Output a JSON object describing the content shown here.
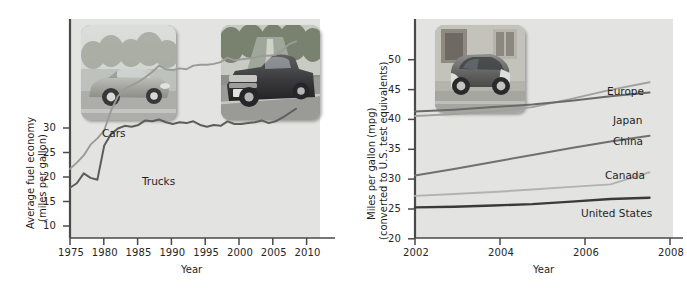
{
  "figure": {
    "background": "#ffffff",
    "plot_background": "#e3e3e1"
  },
  "chart_data": [
    {
      "id": "us-fuel-economy",
      "type": "line",
      "title": "",
      "xlabel": "Year",
      "ylabel": "Average fuel economy (miles per gallon)",
      "ylabel_line1": "Average fuel economy",
      "ylabel_line2": "(miles per gallon)",
      "xlim": [
        1975,
        2011.5
      ],
      "ylim": [
        8.2,
        32.6
      ],
      "xticks": [
        1975,
        1980,
        1985,
        1990,
        1995,
        2000,
        2005,
        2010
      ],
      "yticks": [
        10,
        15,
        20,
        25,
        30
      ],
      "grid": false,
      "legend_position": "inline-annotation",
      "series": [
        {
          "name": "Cars",
          "color": "#9a9a99",
          "label_x": 1981.2,
          "label_y": 26.6,
          "x": [
            1975,
            1976,
            1977,
            1978,
            1979,
            1980,
            1981,
            1982,
            1983,
            1984,
            1985,
            1986,
            1987,
            1988,
            1989,
            1990,
            1991,
            1992,
            1993,
            1994,
            1995,
            1996,
            1997,
            1998,
            1999,
            2000,
            2001,
            2002,
            2003,
            2004,
            2005,
            2006,
            2007,
            2008
          ],
          "values": [
            15.9,
            16.6,
            17.4,
            18.6,
            19.3,
            20.2,
            22.4,
            24.0,
            24.8,
            25.2,
            25.6,
            26.1,
            26.7,
            27.4,
            27.0,
            26.9,
            27.1,
            27.0,
            27.4,
            27.5,
            27.5,
            27.6,
            27.8,
            28.3,
            28.0,
            28.1,
            28.2,
            28.3,
            28.5,
            28.5,
            28.6,
            29.1,
            29.8,
            30.1
          ]
        },
        {
          "name": "Trucks",
          "color": "#5d5d5d",
          "label_x": 1988.2,
          "label_y": 18.4,
          "x": [
            1975,
            1976,
            1977,
            1978,
            1979,
            1980,
            1981,
            1982,
            1983,
            1984,
            1985,
            1986,
            1987,
            1988,
            1989,
            1990,
            1991,
            1992,
            1993,
            1994,
            1995,
            1996,
            1997,
            1998,
            1999,
            2000,
            2001,
            2002,
            2003,
            2004,
            2005,
            2006,
            2007,
            2008
          ],
          "values": [
            13.8,
            14.3,
            15.4,
            14.9,
            14.7,
            18.5,
            19.8,
            20.4,
            20.7,
            20.6,
            20.8,
            21.3,
            21.2,
            21.4,
            21.1,
            20.9,
            21.1,
            21.0,
            21.2,
            20.8,
            20.6,
            20.8,
            20.7,
            21.2,
            20.9,
            20.9,
            21.0,
            21.1,
            21.3,
            21.0,
            21.2,
            21.6,
            22.1,
            22.6
          ]
        }
      ]
    },
    {
      "id": "international-fuel-economy",
      "type": "line",
      "title": "",
      "xlabel": "Year",
      "ylabel": "Miles per gallon (mpg) (converted to U.S. test equivalents)",
      "ylabel_line1": "Miles per gallon (mpg)",
      "ylabel_line2": "(converted to U.S. test equivalents)",
      "xlim": [
        2002,
        2008.6
      ],
      "ylim": [
        19.2,
        53.5
      ],
      "xticks": [
        2002,
        2004,
        2006,
        2008
      ],
      "yticks": [
        20,
        25,
        30,
        35,
        40,
        45,
        50
      ],
      "grid": false,
      "legend_position": "right-inline-labels",
      "series": [
        {
          "name": "Europe",
          "color": "#a0a09e",
          "label_y": 44.6,
          "x": [
            2002,
            2003,
            2004,
            2005,
            2006,
            2007,
            2008
          ],
          "values": [
            38.3,
            38.6,
            39.0,
            39.7,
            41.0,
            42.4,
            43.6
          ]
        },
        {
          "name": "Japan",
          "color": "#6a6a6a",
          "label_y": 40.4,
          "x": [
            2002,
            2003,
            2004,
            2005,
            2006,
            2007,
            2008
          ],
          "values": [
            39.0,
            39.3,
            39.7,
            40.1,
            40.7,
            41.4,
            42.0
          ]
        },
        {
          "name": "China",
          "color": "#707070",
          "label_y": 37.3,
          "x": [
            2002,
            2003,
            2004,
            2005,
            2006,
            2007,
            2008
          ],
          "values": [
            29.0,
            30.0,
            31.1,
            32.2,
            33.3,
            34.3,
            35.2
          ]
        },
        {
          "name": "Canada",
          "color": "#b2b2b0",
          "label_y": 32.3,
          "x": [
            2002,
            2003,
            2004,
            2005,
            2006,
            2007,
            2008
          ],
          "values": [
            25.8,
            26.1,
            26.4,
            26.8,
            27.2,
            27.6,
            29.5
          ]
        },
        {
          "name": "United States",
          "color": "#3a3a3a",
          "label_y": 22.9,
          "x": [
            2002,
            2003,
            2004,
            2005,
            2006,
            2007,
            2008
          ],
          "values": [
            24.0,
            24.1,
            24.3,
            24.5,
            24.9,
            25.3,
            25.5
          ]
        }
      ]
    }
  ],
  "photos": [
    {
      "id": "sedan-photo",
      "alt": "Silver sedan car on a road",
      "chart": "left"
    },
    {
      "id": "pickup-truck-photo",
      "alt": "Dark pickup truck on a road",
      "chart": "left"
    },
    {
      "id": "smart-car-photo",
      "alt": "Small two-seat city car parked by a building",
      "chart": "right"
    }
  ]
}
